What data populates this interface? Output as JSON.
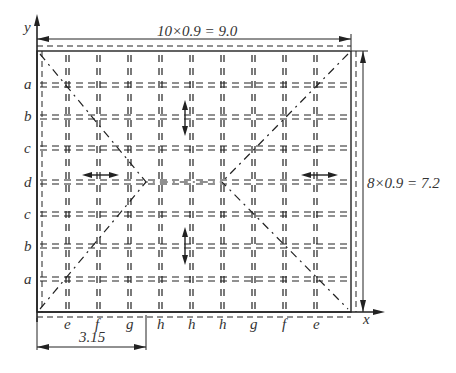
{
  "diagram": {
    "axes": {
      "x_label": "x",
      "y_label": "y"
    },
    "dimensions": {
      "width_formula": "10×0.9 = 9.0",
      "height_formula": "8×0.9 = 7.2",
      "offset": "3.15"
    },
    "row_labels": [
      "a",
      "b",
      "c",
      "d",
      "c",
      "b",
      "a"
    ],
    "column_labels": [
      "e",
      "f",
      "g",
      "h",
      "h",
      "h",
      "g",
      "f",
      "e"
    ],
    "colors": {
      "line": "#222222",
      "text": "#333333",
      "background": "#ffffff"
    }
  }
}
